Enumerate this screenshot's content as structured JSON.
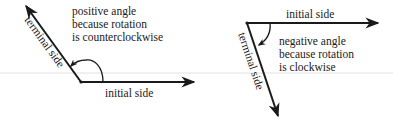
{
  "colors": {
    "ink": "#1a1a1a",
    "background": "#ffffff",
    "scan_line": "#d8d8d8"
  },
  "diagrams": [
    {
      "id": "positive",
      "initial_side_label": "initial side",
      "terminal_side_label": "terminal side",
      "caption_lines": [
        "positive angle",
        "because rotation",
        "is counterclockwise"
      ],
      "rotation": "counterclockwise",
      "vertex": [
        81,
        82
      ],
      "initial_tip": [
        194,
        82
      ],
      "terminal_tip": [
        26,
        6
      ]
    },
    {
      "id": "negative",
      "initial_side_label": "initial side",
      "terminal_side_label": "terminal side",
      "caption_lines": [
        "negative angle",
        "because rotation",
        "is clockwise"
      ],
      "rotation": "clockwise",
      "vertex": [
        247,
        23
      ],
      "initial_tip": [
        378,
        23
      ],
      "terminal_tip": [
        278,
        116
      ]
    }
  ]
}
